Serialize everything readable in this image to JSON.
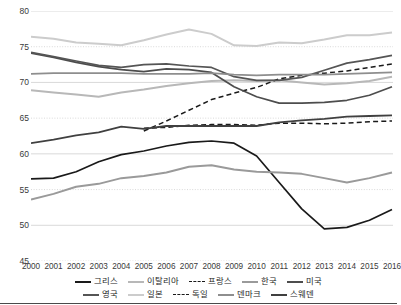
{
  "chart_data": {
    "type": "line",
    "title": "",
    "xlabel": "",
    "ylabel": "",
    "ylim": [
      45,
      80
    ],
    "ytick_step": 5,
    "grid": true,
    "legend_position": "bottom",
    "x": [
      2000,
      2001,
      2002,
      2003,
      2004,
      2005,
      2006,
      2007,
      2008,
      2009,
      2010,
      2011,
      2012,
      2013,
      2014,
      2015,
      2016
    ],
    "categories": [
      "2000",
      "2001",
      "2002",
      "2003",
      "2004",
      "2005",
      "2006",
      "2007",
      "2008",
      "2009",
      "2010",
      "2011",
      "2012",
      "2013",
      "2014",
      "2015",
      "2016"
    ],
    "yticks": [
      45,
      50,
      55,
      60,
      65,
      70,
      75,
      80
    ],
    "ytick_labels": [
      "45",
      "50",
      "55",
      "60",
      "65",
      "70",
      "75",
      "80"
    ],
    "series": [
      {
        "name": "그리스",
        "color": "#1a1a1a",
        "style": "solid",
        "width": 1.7,
        "values": [
          56.5,
          56.6,
          57.5,
          58.9,
          59.9,
          60.4,
          61.1,
          61.6,
          61.8,
          61.5,
          59.7,
          56.0,
          52.3,
          49.5,
          49.7,
          50.7,
          52.2
        ]
      },
      {
        "name": "이탈리아",
        "color": "#b8b8b8",
        "style": "solid",
        "width": 2.0,
        "values": [
          68.9,
          68.6,
          68.3,
          68.0,
          68.6,
          69.0,
          69.5,
          69.9,
          70.2,
          70.3,
          70.2,
          70.3,
          70.0,
          69.7,
          69.9,
          70.2,
          70.8
        ]
      },
      {
        "name": "프랑스",
        "color": "#1a1a1a",
        "style": "dashed",
        "width": 1.5,
        "values": [
          null,
          null,
          null,
          null,
          null,
          63.2,
          64.6,
          66.1,
          67.6,
          68.5,
          69.3,
          70.5,
          71.0,
          71.3,
          71.6,
          72.1,
          72.6
        ]
      },
      {
        "name": "한국",
        "color": "#9a9a9a",
        "style": "solid",
        "width": 2.0,
        "values": [
          53.6,
          54.4,
          55.4,
          55.8,
          56.6,
          56.9,
          57.4,
          58.2,
          58.4,
          57.8,
          57.5,
          57.4,
          57.2,
          56.6,
          56.0,
          56.6,
          57.4
        ]
      },
      {
        "name": "미국",
        "color": "#4d4d4d",
        "style": "solid",
        "width": 1.7,
        "values": [
          74.1,
          73.5,
          72.8,
          72.2,
          71.8,
          71.5,
          71.9,
          71.8,
          71.4,
          69.4,
          68.0,
          67.1,
          67.1,
          67.2,
          67.5,
          68.2,
          69.4
        ]
      },
      {
        "name": "영국",
        "color": "#555555",
        "style": "solid",
        "width": 1.7,
        "values": [
          74.2,
          73.6,
          73.0,
          72.4,
          72.1,
          72.5,
          72.6,
          72.3,
          72.1,
          70.8,
          70.3,
          70.3,
          70.7,
          71.7,
          72.7,
          73.2,
          73.8
        ]
      },
      {
        "name": "일본",
        "color": "#cccccc",
        "style": "solid",
        "width": 2.0,
        "values": [
          76.4,
          76.1,
          75.6,
          75.4,
          75.2,
          75.9,
          76.7,
          77.4,
          76.8,
          75.2,
          75.1,
          75.6,
          75.5,
          76.0,
          76.6,
          76.6,
          77.0
        ]
      },
      {
        "name": "독일",
        "color": "#1a1a1a",
        "style": "dashed",
        "width": 1.5,
        "values": [
          null,
          null,
          null,
          null,
          null,
          63.6,
          63.7,
          64.0,
          64.1,
          64.1,
          64.0,
          64.3,
          64.3,
          64.2,
          64.3,
          64.5,
          64.6
        ]
      },
      {
        "name": "덴마크",
        "color": "#8e8e8e",
        "style": "solid",
        "width": 1.8,
        "values": [
          71.2,
          71.3,
          71.3,
          71.3,
          71.3,
          71.2,
          71.2,
          71.2,
          71.3,
          71.1,
          71.0,
          71.1,
          71.1,
          71.1,
          71.2,
          71.3,
          71.4
        ]
      },
      {
        "name": "스웨덴",
        "color": "#404040",
        "style": "solid",
        "width": 1.8,
        "values": [
          61.5,
          62.0,
          62.6,
          63.0,
          63.8,
          63.5,
          63.9,
          63.9,
          63.9,
          63.9,
          63.9,
          64.4,
          64.7,
          64.9,
          65.2,
          65.3,
          65.4
        ]
      }
    ],
    "legend_rows": [
      [
        "그리스",
        "이탈리아",
        "프랑스",
        "한국",
        "미국"
      ],
      [
        "영국",
        "일본",
        "독일",
        "덴마크",
        "스웨덴"
      ]
    ]
  }
}
